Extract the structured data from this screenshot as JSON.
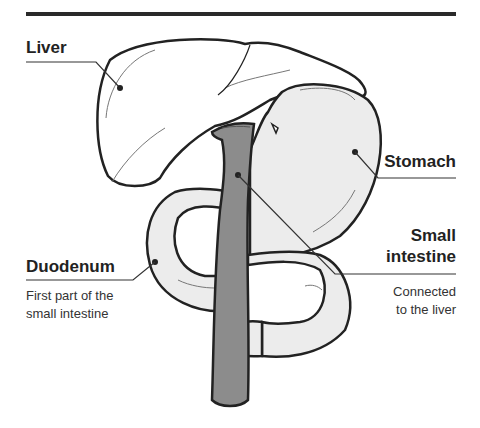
{
  "diagram": {
    "labels": {
      "liver": {
        "title": "Liver"
      },
      "stomach": {
        "title": "Stomach"
      },
      "duodenum": {
        "title": "Duodenum",
        "description_line1": "First part of the",
        "description_line2": "small intestine"
      },
      "small_intestine": {
        "title_line1": "Small",
        "title_line2": "intestine",
        "description_line1": "Connected",
        "description_line2": "to the liver"
      }
    },
    "colors": {
      "outline": "#222222",
      "organ_fill": "#ececec",
      "liver_fill": "#ffffff",
      "tube_fill": "#8c8c8c",
      "rule": "#2a2a2a"
    }
  }
}
